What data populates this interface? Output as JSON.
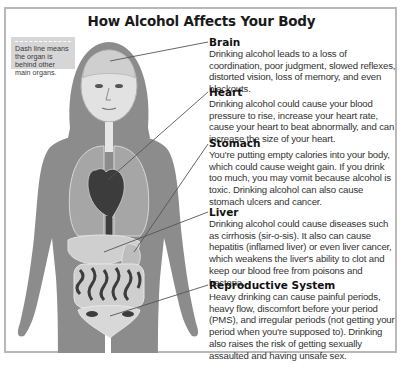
{
  "title": "How Alcohol Affects Your Body",
  "legend_note": {
    "text": "Dash line means the organ is behind other main organs."
  },
  "colors": {
    "frame_border": "#b8b8b8",
    "body_silhouette": "#8c8c8c",
    "organ_fill": "#d0d0d0",
    "organ_dark": "#3c3c3c",
    "note_bg": "#d6d6d6",
    "heading_text": "#111111",
    "body_text": "#333333"
  },
  "sections": [
    {
      "heading": "Brain",
      "text": "Drinking alcohol leads to a loss of coordination, poor judgment, slowed reflexes, distorted vision, loss of memory, and even blackouts."
    },
    {
      "heading": "Heart",
      "text": "Drinking alcohol could cause your blood pressure to rise, increase your heart rate, cause your heart to beat abnormally, and can increase the size of your heart."
    },
    {
      "heading": "Stomach",
      "text": "You're putting empty calories into your body, which could cause weight gain. If you drink too much, you may vomit because alcohol is toxic.  Drinking alcohol can also cause stomach ulcers and cancer."
    },
    {
      "heading": "Liver",
      "text": "Drinking alcohol could cause diseases such as cirrhosis (sir-o-sis). It also can cause hepatitis (inflamed liver) or even liver cancer, which weakens the liver's ability to clot and keep our blood free from poisons and bacteria."
    },
    {
      "heading": "Reproductive System",
      "text": "Heavy drinking can cause painful periods, heavy flow, discomfort before your period (PMS), and irregular periods (not getting your period when you're supposed to). Drinking also raises the risk of getting sexually assaulted and having unsafe sex."
    }
  ]
}
